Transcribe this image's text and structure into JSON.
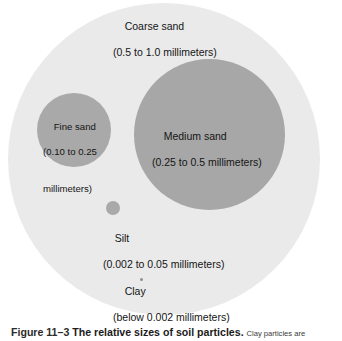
{
  "figure": {
    "alt_title": "The relative sizes of soil particles",
    "particles": [
      {
        "id": "coarse-sand",
        "name": "Coarse sand",
        "size_range": "(0.5 to 1.0 millimeters)",
        "color": "#eaeaea"
      },
      {
        "id": "medium-sand",
        "name": "Medium sand",
        "size_range": "(0.25 to 0.5 millimeters)",
        "color": "#a7a7a7"
      },
      {
        "id": "fine-sand",
        "name": "Fine sand",
        "size_range_line1": "(0.10 to 0.25",
        "size_range_line2": "millimeters)",
        "color": "#a9a9a9"
      },
      {
        "id": "silt",
        "name": "Silt",
        "size_range": "(0.002 to 0.05 millimeters)",
        "color": "#a9a9a9"
      },
      {
        "id": "clay",
        "name": "Clay",
        "size_range": "(below 0.002 millimeters)",
        "color": "#8f8f8f"
      }
    ]
  },
  "caption": {
    "figure_number": "Figure 11–3",
    "title": "The relative sizes of soil particles.",
    "rest": "Clay particles are"
  },
  "chart_data": {
    "type": "bubble",
    "title": "The relative sizes of soil particles",
    "xlabel": "",
    "ylabel": "",
    "grid": false,
    "legend": "none",
    "value_unit": "millimeters",
    "categories": [
      "Coarse sand",
      "Medium sand",
      "Fine sand",
      "Silt",
      "Clay"
    ],
    "series": [
      {
        "name": "Particle diameter range (mm)",
        "points": [
          {
            "label": "Coarse sand",
            "min": 0.5,
            "max": 1.0,
            "range_text": "(0.5 to 1.0 millimeters)",
            "pixel_diameter": 312,
            "color": "#eaeaea"
          },
          {
            "label": "Medium sand",
            "min": 0.25,
            "max": 0.5,
            "range_text": "(0.25 to 0.5 millimeters)",
            "pixel_diameter": 151,
            "color": "#a7a7a7"
          },
          {
            "label": "Fine sand",
            "min": 0.1,
            "max": 0.25,
            "range_text": "(0.10 to 0.25 millimeters)",
            "pixel_diameter": 74,
            "color": "#a9a9a9"
          },
          {
            "label": "Silt",
            "min": 0.002,
            "max": 0.05,
            "range_text": "(0.002 to 0.05 millimeters)",
            "pixel_diameter": 14,
            "color": "#a9a9a9"
          },
          {
            "label": "Clay",
            "min": 0,
            "max": 0.002,
            "range_text": "(below 0.002 millimeters)",
            "pixel_diameter": 3,
            "color": "#8f8f8f"
          }
        ]
      }
    ]
  }
}
